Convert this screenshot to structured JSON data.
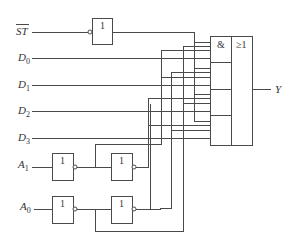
{
  "diagram": {
    "type": "logic-circuit",
    "inputs": {
      "strobe": {
        "label": "ST",
        "overbar": true
      },
      "data": [
        {
          "label": "D",
          "sub": "0"
        },
        {
          "label": "D",
          "sub": "1"
        },
        {
          "label": "D",
          "sub": "2"
        },
        {
          "label": "D",
          "sub": "3"
        }
      ],
      "address": [
        {
          "label": "A",
          "sub": "1"
        },
        {
          "label": "A",
          "sub": "0"
        }
      ]
    },
    "output": {
      "label": "Y"
    },
    "gates": {
      "inverter_symbol": "1",
      "and_symbol": "&",
      "or_symbol": "≥1"
    },
    "line_color": "#4a4a4a"
  }
}
